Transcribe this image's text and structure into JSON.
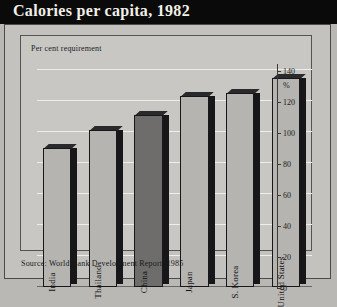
{
  "title": "Calories per capita, 1982",
  "plot_note": "Per cent requirement",
  "source": "Source: World Bank Development Report, 1985",
  "colors": {
    "title_bar": "#0a0a0a",
    "title_text": "#f2efe9",
    "panel": "#c3c2be",
    "plot_bg": "#c8c7c3",
    "bar_normal": "#b5b4b0",
    "bar_highlight": "#6e6d6b",
    "bar_outline": "#18181a",
    "gridline": "#eeeeea"
  },
  "chart_data": {
    "type": "bar",
    "title": "Calories per capita, 1982",
    "subtitle": "Per cent requirement",
    "categories": [
      "India",
      "Thailand",
      "China",
      "Japan",
      "S. Korea",
      "United States"
    ],
    "values": [
      90,
      101,
      111,
      123,
      125,
      135
    ],
    "series": [
      {
        "name": "Per cent requirement",
        "values": [
          90,
          101,
          111,
          123,
          125,
          135
        ]
      }
    ],
    "highlighted_category": "China",
    "xlabel": "",
    "ylabel": "%",
    "ylim": [
      0,
      140
    ],
    "yticks": [
      0,
      20,
      40,
      60,
      80,
      100,
      120,
      140
    ],
    "ytick_labels": [
      "0",
      "20",
      "40",
      "60",
      "80",
      "100",
      "120",
      "140"
    ],
    "y_unit_label": "%",
    "axis_position": "right",
    "grid": true,
    "legend": "none",
    "source": "Source: World Bank Development Report, 1985"
  }
}
